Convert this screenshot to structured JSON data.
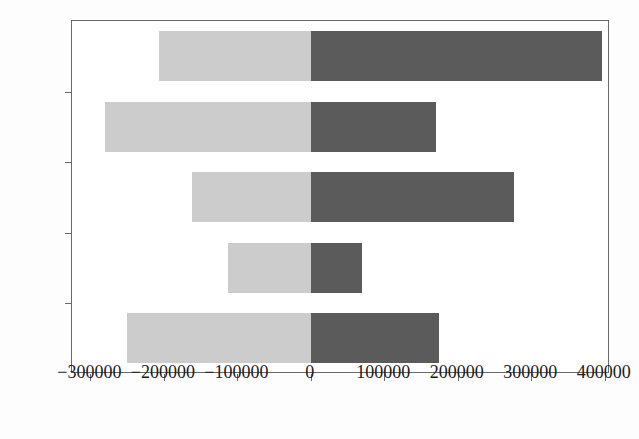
{
  "chart_data": {
    "type": "bar",
    "orientation": "horizontal",
    "stacked": true,
    "title": "",
    "xlabel": "",
    "ylabel": "",
    "categories": [
      "2019",
      "2018",
      "2017",
      "2016",
      "2015"
    ],
    "series": [
      {
        "name": "negative",
        "color": "#cccccc",
        "values": [
          -207000,
          -280000,
          -162000,
          -113000,
          -250000
        ]
      },
      {
        "name": "positive",
        "color": "#5b5b5b",
        "values": [
          396000,
          170000,
          277000,
          69000,
          174000
        ]
      }
    ],
    "xlim": [
      -325000,
      407000
    ],
    "xticks": [
      -300000,
      -200000,
      -100000,
      0,
      100000,
      200000,
      300000,
      400000
    ],
    "xtick_labels": [
      "−300000",
      "−200000",
      "−100000",
      "0",
      "100000",
      "200000",
      "300000",
      "400000"
    ],
    "grid": false,
    "legend": "none"
  },
  "axes": {
    "frame_color": "#6a6a6a",
    "background": "#ffffff"
  }
}
